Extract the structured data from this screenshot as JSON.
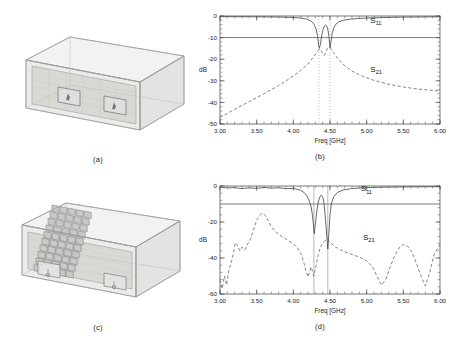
{
  "figure": {
    "panels": [
      {
        "id": "a",
        "caption": "(a)",
        "type": "cad",
        "description": "3D waveguide cavity with two rectangular apertures and coaxial probes"
      },
      {
        "id": "b",
        "caption": "(b)",
        "type": "chart"
      },
      {
        "id": "c",
        "caption": "(c)",
        "type": "cad",
        "description": "3D waveguide cavity loaded with metamaterial unit-cell array between the two probe apertures"
      },
      {
        "id": "d",
        "caption": "(d)",
        "type": "chart"
      }
    ]
  },
  "cad_a": {
    "caption": "(a)",
    "aperture_count": 2,
    "probe_count": 2
  },
  "cad_c": {
    "caption": "(c)",
    "aperture_count": 2,
    "probe_count": 2,
    "array_columns": 5,
    "array_rows": 12
  },
  "chart_data": [
    {
      "id": "b",
      "type": "line",
      "title": "",
      "caption": "(b)",
      "xlabel": "Freq [GHz]",
      "ylabel": "dB",
      "xlim": [
        3.0,
        6.0
      ],
      "ylim": [
        -50,
        0
      ],
      "xticks": [
        3.0,
        3.5,
        4.0,
        4.5,
        5.0,
        5.5,
        6.0
      ],
      "xticklabels": [
        "3.00",
        "3.50",
        "4.00",
        "4.50",
        "5.00",
        "5.50",
        "6.00"
      ],
      "yticks": [
        0,
        -10,
        -20,
        -30,
        -40,
        -50
      ],
      "yticklabels": [
        "0",
        "-10",
        "-20",
        "-30",
        "-40",
        "-50"
      ],
      "grid": false,
      "legend_position": "inline-annotation",
      "reference_lines": [
        {
          "axis": "y",
          "value": -10,
          "style": "solid"
        }
      ],
      "marker_lines": [
        {
          "axis": "x",
          "value": 4.35,
          "style": "dotted"
        },
        {
          "axis": "x",
          "value": 4.5,
          "style": "dotted"
        }
      ],
      "annotations": [
        {
          "text": "S11",
          "label": "S",
          "sub": "11",
          "x": 5.05,
          "y": -3.2
        },
        {
          "text": "S21",
          "label": "S",
          "sub": "21",
          "x": 5.05,
          "y": -26.0
        }
      ],
      "series": [
        {
          "name": "S11",
          "style": "solid",
          "x": [
            3.0,
            3.2,
            3.4,
            3.6,
            3.8,
            4.0,
            4.1,
            4.18,
            4.24,
            4.28,
            4.31,
            4.33,
            4.345,
            4.355,
            4.37,
            4.39,
            4.41,
            4.425,
            4.44,
            4.455,
            4.47,
            4.485,
            4.5,
            4.515,
            4.53,
            4.55,
            4.58,
            4.62,
            4.68,
            4.76,
            4.88,
            5.0,
            5.2,
            5.4,
            5.6,
            5.8,
            6.0
          ],
          "y": [
            -0.3,
            -0.32,
            -0.35,
            -0.4,
            -0.48,
            -0.7,
            -0.95,
            -1.4,
            -2.3,
            -3.6,
            -6.0,
            -9.0,
            -13.5,
            -15.0,
            -13.0,
            -8.5,
            -5.8,
            -4.6,
            -4.2,
            -4.6,
            -6.0,
            -9.5,
            -14.8,
            -11.5,
            -8.0,
            -5.5,
            -3.8,
            -2.7,
            -2.0,
            -1.5,
            -1.15,
            -0.95,
            -0.72,
            -0.58,
            -0.48,
            -0.42,
            -0.38
          ]
        },
        {
          "name": "S21",
          "style": "dashed",
          "x": [
            3.0,
            3.2,
            3.4,
            3.6,
            3.8,
            4.0,
            4.1,
            4.2,
            4.28,
            4.33,
            4.355,
            4.38,
            4.4,
            4.42,
            4.435,
            4.45,
            4.465,
            4.48,
            4.5,
            4.52,
            4.55,
            4.6,
            4.7,
            4.8,
            4.95,
            5.1,
            5.3,
            5.5,
            5.7,
            5.85,
            6.0
          ],
          "y": [
            -47.0,
            -43.2,
            -39.6,
            -36.0,
            -32.2,
            -27.8,
            -25.2,
            -22.2,
            -18.8,
            -16.4,
            -15.3,
            -16.2,
            -17.4,
            -18.2,
            -17.4,
            -16.0,
            -15.0,
            -14.6,
            -14.5,
            -15.4,
            -17.0,
            -19.5,
            -23.0,
            -25.5,
            -28.0,
            -29.8,
            -31.6,
            -32.9,
            -33.8,
            -34.3,
            -34.7
          ]
        }
      ]
    },
    {
      "id": "d",
      "type": "line",
      "title": "",
      "caption": "(d)",
      "xlabel": "Freq [GHz]",
      "ylabel": "dB",
      "xlim": [
        3.0,
        6.0
      ],
      "ylim": [
        -60,
        0
      ],
      "xticks": [
        3.0,
        3.5,
        4.0,
        4.5,
        5.0,
        5.5,
        6.0
      ],
      "xticklabels": [
        "3.00",
        "3.50",
        "4.00",
        "4.50",
        "5.00",
        "5.50",
        "6.00"
      ],
      "yticks": [
        0,
        -20,
        -40,
        -60
      ],
      "yticklabels": [
        "0",
        "-20",
        "-40",
        "-60"
      ],
      "grid": false,
      "legend_position": "inline-annotation",
      "reference_lines": [
        {
          "axis": "y",
          "value": -10,
          "style": "solid"
        }
      ],
      "marker_lines": [
        {
          "axis": "x",
          "value": 4.28,
          "style": "solid-thin"
        },
        {
          "axis": "x",
          "value": 4.47,
          "style": "solid-thin"
        }
      ],
      "annotations": [
        {
          "text": "S11",
          "label": "S",
          "sub": "11",
          "x": 4.92,
          "y": -3.0
        },
        {
          "text": "S21",
          "label": "S",
          "sub": "21",
          "x": 4.95,
          "y": -30.0
        }
      ],
      "series": [
        {
          "name": "S11",
          "style": "solid",
          "x": [
            3.0,
            3.1,
            3.2,
            3.3,
            3.4,
            3.5,
            3.6,
            3.7,
            3.8,
            3.9,
            4.0,
            4.05,
            4.1,
            4.14,
            4.18,
            4.21,
            4.24,
            4.26,
            4.275,
            4.285,
            4.3,
            4.32,
            4.34,
            4.36,
            4.38,
            4.4,
            4.415,
            4.43,
            4.445,
            4.46,
            4.47,
            4.485,
            4.5,
            4.52,
            4.55,
            4.6,
            4.68,
            4.78,
            4.9,
            5.05,
            5.25,
            5.45,
            5.65,
            5.85,
            6.0
          ],
          "y": [
            -0.6,
            -1.1,
            -0.9,
            -1.4,
            -1.0,
            -1.3,
            -0.8,
            -1.2,
            -0.95,
            -1.5,
            -1.3,
            -1.8,
            -2.4,
            -3.4,
            -5.2,
            -7.5,
            -11.0,
            -16.0,
            -22.0,
            -26.5,
            -21.0,
            -14.0,
            -9.0,
            -6.2,
            -5.0,
            -5.8,
            -9.0,
            -14.5,
            -22.0,
            -30.0,
            -35.0,
            -26.0,
            -16.0,
            -9.5,
            -6.0,
            -3.6,
            -2.2,
            -1.5,
            -1.1,
            -0.85,
            -0.65,
            -0.55,
            -0.48,
            -0.42,
            -0.4
          ]
        },
        {
          "name": "S21",
          "style": "dashed",
          "x": [
            3.0,
            3.03,
            3.06,
            3.09,
            3.12,
            3.15,
            3.18,
            3.21,
            3.24,
            3.27,
            3.3,
            3.34,
            3.38,
            3.42,
            3.46,
            3.5,
            3.54,
            3.58,
            3.62,
            3.66,
            3.7,
            3.76,
            3.82,
            3.88,
            3.94,
            4.0,
            4.06,
            4.1,
            4.14,
            4.17,
            4.2,
            4.22,
            4.24,
            4.26,
            4.28,
            4.31,
            4.34,
            4.37,
            4.4,
            4.43,
            4.46,
            4.49,
            4.52,
            4.56,
            4.62,
            4.7,
            4.8,
            4.9,
            5.0,
            5.08,
            5.14,
            5.2,
            5.26,
            5.32,
            5.38,
            5.44,
            5.5,
            5.56,
            5.62,
            5.68,
            5.74,
            5.8,
            5.86,
            5.92,
            6.0
          ],
          "y": [
            -52.0,
            -57.0,
            -50.0,
            -55.0,
            -47.0,
            -43.0,
            -38.0,
            -31.5,
            -33.0,
            -36.0,
            -34.0,
            -35.5,
            -32.0,
            -29.0,
            -24.0,
            -19.0,
            -16.5,
            -15.0,
            -16.5,
            -19.5,
            -22.5,
            -25.5,
            -27.5,
            -29.0,
            -30.5,
            -32.0,
            -34.5,
            -37.5,
            -42.0,
            -47.0,
            -50.5,
            -48.0,
            -45.0,
            -47.0,
            -50.0,
            -44.0,
            -38.0,
            -34.0,
            -31.5,
            -30.5,
            -29.5,
            -30.5,
            -32.0,
            -33.5,
            -35.0,
            -36.5,
            -38.0,
            -39.5,
            -41.5,
            -45.0,
            -50.0,
            -55.0,
            -52.0,
            -45.0,
            -39.0,
            -34.5,
            -32.5,
            -33.5,
            -37.0,
            -43.0,
            -50.0,
            -55.5,
            -48.0,
            -38.0,
            -32.5
          ]
        }
      ]
    }
  ],
  "colors": {
    "curve_s11": "#4d4d4d",
    "curve_s21": "#6e6e6e",
    "axis": "#555555",
    "reference_line": "#5a5a5a",
    "cad_edge": "#9a9a9a",
    "cad_fill": "#e6e6e4",
    "cad_plate": "#d9d9d6",
    "cad_cell": "#c9c9c6",
    "background": "#ffffff"
  }
}
